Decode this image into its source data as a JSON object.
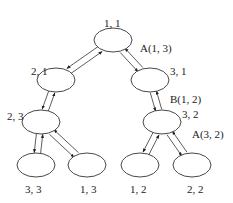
{
  "diagram": {
    "type": "tree",
    "nodes": [
      {
        "id": "n11",
        "label": "1, 1",
        "cx": 113,
        "cy": 40,
        "lx": 104,
        "ly": 18
      },
      {
        "id": "n21",
        "label": "2, 1",
        "cx": 56,
        "cy": 80,
        "lx": 31,
        "ly": 66
      },
      {
        "id": "n31",
        "label": "3, 1",
        "cx": 150,
        "cy": 80,
        "lx": 170,
        "ly": 66
      },
      {
        "id": "n23",
        "label": "2, 3",
        "cx": 41,
        "cy": 122,
        "lx": 7,
        "ly": 111
      },
      {
        "id": "n32",
        "label": "3, 2",
        "cx": 162,
        "cy": 122,
        "lx": 182,
        "ly": 109
      },
      {
        "id": "n33",
        "label": "3, 3",
        "cx": 36,
        "cy": 165,
        "lx": 25,
        "ly": 184
      },
      {
        "id": "n13",
        "label": "1, 3",
        "cx": 87,
        "cy": 165,
        "lx": 80,
        "ly": 184
      },
      {
        "id": "n12",
        "label": "1, 2",
        "cx": 140,
        "cy": 165,
        "lx": 130,
        "ly": 184
      },
      {
        "id": "n22",
        "label": "2, 2",
        "cx": 192,
        "cy": 165,
        "lx": 187,
        "ly": 184
      }
    ],
    "edges": [
      {
        "from": "n11",
        "to": "n21"
      },
      {
        "from": "n11",
        "to": "n31",
        "label": "A(1, 3)"
      },
      {
        "from": "n21",
        "to": "n23"
      },
      {
        "from": "n31",
        "to": "n32",
        "label": "B(1, 2)"
      },
      {
        "from": "n23",
        "to": "n33"
      },
      {
        "from": "n23",
        "to": "n13"
      },
      {
        "from": "n32",
        "to": "n12"
      },
      {
        "from": "n32",
        "to": "n22",
        "label": "A(3, 2)"
      }
    ],
    "edge_labels": [
      {
        "text": "A(1, 3)",
        "x": 140,
        "y": 43
      },
      {
        "text": "B(1, 2)",
        "x": 170,
        "y": 94
      },
      {
        "text": "A(3, 2)",
        "x": 192,
        "y": 129
      }
    ],
    "node_rx": 19,
    "node_ry": 12,
    "colors": {
      "stroke": "#333333",
      "background": "#ffffff",
      "text": "#222222"
    }
  }
}
